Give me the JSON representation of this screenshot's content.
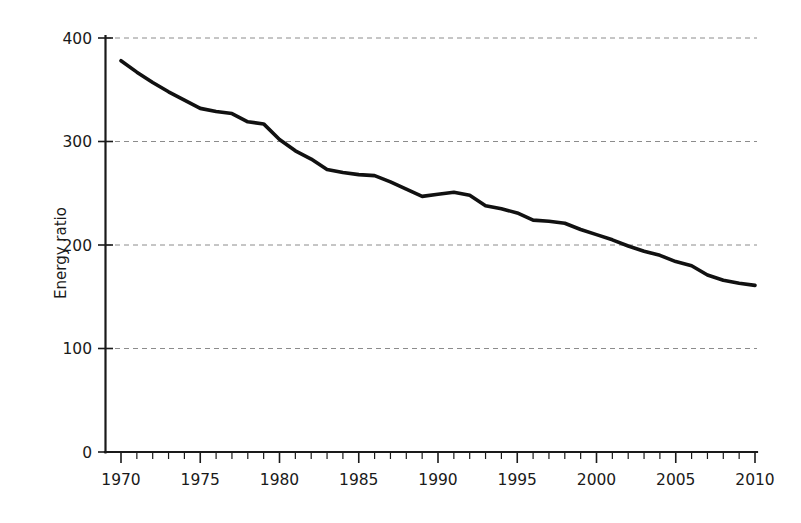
{
  "chart_data": {
    "type": "line",
    "title": "",
    "xlabel": "",
    "ylabel": "Energy ratio",
    "xlim": [
      1970,
      2010
    ],
    "ylim": [
      0,
      400
    ],
    "grid": true,
    "grid_axis": "y",
    "legend": "none",
    "line_color": "#111111",
    "grid_color": "#8c8c8c",
    "axis_color": "#1a1a1a",
    "x_ticks_major": [
      1970,
      1975,
      1980,
      1985,
      1990,
      1995,
      2000,
      2005,
      2010
    ],
    "x_tick_labels": [
      "1970",
      "1975",
      "1980",
      "1985",
      "1990",
      "1995",
      "2000",
      "2005",
      "2010"
    ],
    "x_tick_minor_step": 1,
    "y_ticks": [
      0,
      100,
      200,
      300,
      400
    ],
    "y_tick_labels": [
      "0",
      "100",
      "200",
      "300",
      "400"
    ],
    "series": [
      {
        "name": "Energy ratio",
        "x": [
          1970,
          1971,
          1972,
          1973,
          1974,
          1975,
          1976,
          1977,
          1978,
          1979,
          1980,
          1981,
          1982,
          1983,
          1984,
          1985,
          1986,
          1987,
          1988,
          1989,
          1990,
          1991,
          1992,
          1993,
          1994,
          1995,
          1996,
          1997,
          1998,
          1999,
          2000,
          2001,
          2002,
          2003,
          2004,
          2005,
          2006,
          2007,
          2008,
          2009,
          2010
        ],
        "values": [
          378,
          367,
          357,
          348,
          340,
          332,
          329,
          327,
          319,
          317,
          302,
          291,
          283,
          273,
          270,
          268,
          267,
          261,
          254,
          247,
          249,
          251,
          248,
          238,
          235,
          231,
          224,
          223,
          221,
          215,
          210,
          205,
          199,
          194,
          190,
          184,
          180,
          171,
          166,
          163,
          161
        ]
      }
    ]
  },
  "axis": {
    "y_title": "Energy ratio"
  }
}
